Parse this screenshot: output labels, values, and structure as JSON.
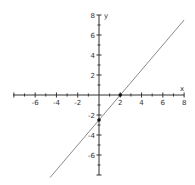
{
  "chart_data": {
    "type": "line",
    "title": "",
    "xlabel": "x",
    "ylabel": "y",
    "xlim": [
      -8,
      8
    ],
    "ylim": [
      -8,
      8
    ],
    "grid": false,
    "x_ticks_labeled": [
      -6,
      -4,
      -2,
      2,
      4,
      6,
      8
    ],
    "y_ticks_labeled": [
      8,
      6,
      4,
      2,
      -2,
      -4,
      -6
    ],
    "minor_tick_step": 1,
    "series": [
      {
        "name": "line",
        "equation": "y = 1.25x - 2.5",
        "x": [
          -4.6,
          8
        ],
        "y": [
          -8.25,
          7.5
        ],
        "color": "#8a8a8a"
      }
    ],
    "points": [
      {
        "label": "x-intercept",
        "x": 2,
        "y": 0
      },
      {
        "label": "y-intercept",
        "x": 0,
        "y": -2.5
      }
    ]
  },
  "axes": {
    "x_label": "x",
    "y_label": "y",
    "axis_color": "#333333",
    "point_color": "#111111"
  }
}
